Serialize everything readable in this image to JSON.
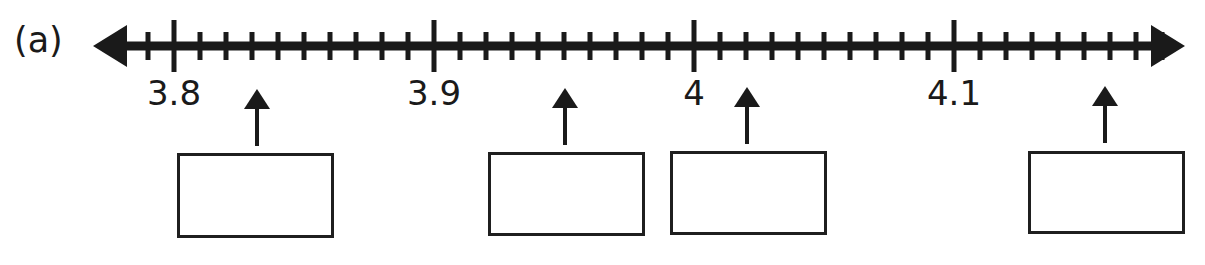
{
  "figure": {
    "panel_label": "(a)",
    "type": "number-line-with-blank-boxes"
  },
  "number_line": {
    "axis_y": 46,
    "x_start": 93,
    "x_end": 1185,
    "line_thickness": 9,
    "left_arrow": "left-arrowhead",
    "right_arrow": "right-arrowhead",
    "minor_step_value": 0.01,
    "minor_step_px": 26,
    "major_step_value": 0.1,
    "major_step_px": 260,
    "major_tick_height": 52,
    "minor_tick_height": 28,
    "tick_color": "#1a1a1a",
    "minor_tick_positions_px": [
      122,
      148,
      200,
      226,
      252,
      278,
      304,
      330,
      356,
      382,
      408,
      460,
      486,
      512,
      538,
      564,
      590,
      616,
      642,
      668,
      720,
      746,
      772,
      798,
      824,
      850,
      876,
      902,
      928,
      980,
      1006,
      1032,
      1058,
      1084,
      1110,
      1136,
      1162
    ],
    "major_ticks": [
      {
        "label": "3.8",
        "value": 3.8,
        "x": 174
      },
      {
        "label": "3.9",
        "value": 3.9,
        "x": 434
      },
      {
        "label": "4",
        "value": 4,
        "x": 694
      },
      {
        "label": "4.1",
        "value": 4.1,
        "x": 954
      }
    ],
    "label_y": 76
  },
  "pointers": [
    {
      "name": "pointer-1",
      "x": 257,
      "value": 3.832,
      "tip_y": 89,
      "tail_y": 146,
      "answer_box": {
        "x": 177,
        "y": 153,
        "width": 157,
        "height": 85,
        "text": ""
      }
    },
    {
      "name": "pointer-2",
      "x": 565,
      "value": 3.95,
      "tip_y": 88,
      "tail_y": 145,
      "answer_box": {
        "x": 488,
        "y": 152,
        "width": 157,
        "height": 84,
        "text": ""
      }
    },
    {
      "name": "pointer-3",
      "x": 747,
      "value": 4.02,
      "tip_y": 87,
      "tail_y": 144,
      "answer_box": {
        "x": 670,
        "y": 151,
        "width": 157,
        "height": 84,
        "text": ""
      }
    },
    {
      "name": "pointer-4",
      "x": 1105,
      "value": 4.158,
      "tip_y": 86,
      "tail_y": 143,
      "answer_box": {
        "x": 1028,
        "y": 151,
        "width": 157,
        "height": 83,
        "text": ""
      }
    }
  ],
  "colors": {
    "ink": "#1a1a1a",
    "box_border": "#1f1f1f",
    "background": "#ffffff"
  }
}
